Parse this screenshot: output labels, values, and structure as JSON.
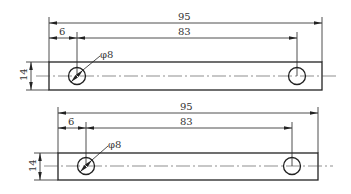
{
  "drawings": [
    {
      "id": "top",
      "dims": {
        "overall_length": "95",
        "hole_spacing": "83",
        "edge_offset": "6",
        "hole_diameter": "φ8",
        "width": "14"
      }
    },
    {
      "id": "bottom",
      "dims": {
        "overall_length": "95",
        "hole_spacing": "83",
        "edge_offset": "6",
        "hole_diameter": "φ8",
        "width": "14"
      }
    }
  ],
  "colors": {
    "line": "#222222",
    "text": "#333333",
    "background": "#ffffff"
  }
}
